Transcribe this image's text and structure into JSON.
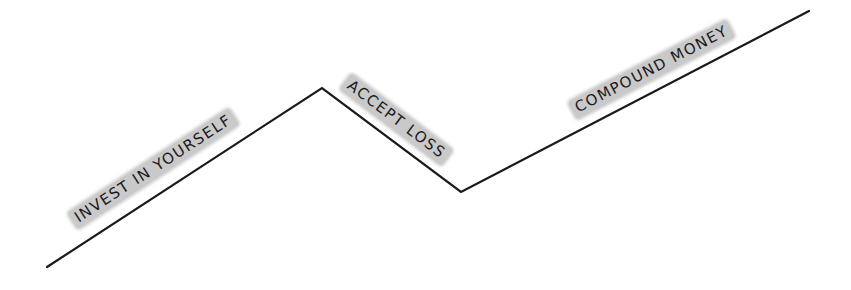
{
  "diagram": {
    "type": "hand-drawn zigzag path",
    "line_color": "#1a1a1a",
    "highlight_color": "#c9c9c9",
    "points": [
      {
        "x": 47,
        "y": 267
      },
      {
        "x": 322,
        "y": 88
      },
      {
        "x": 461,
        "y": 192
      },
      {
        "x": 809,
        "y": 11
      }
    ],
    "segments": [
      {
        "label": "INVEST IN YOURSELF",
        "direction": "up"
      },
      {
        "label": "ACCEPT LOSS",
        "direction": "down"
      },
      {
        "label": "COMPOUND MONEY",
        "direction": "up"
      }
    ]
  }
}
